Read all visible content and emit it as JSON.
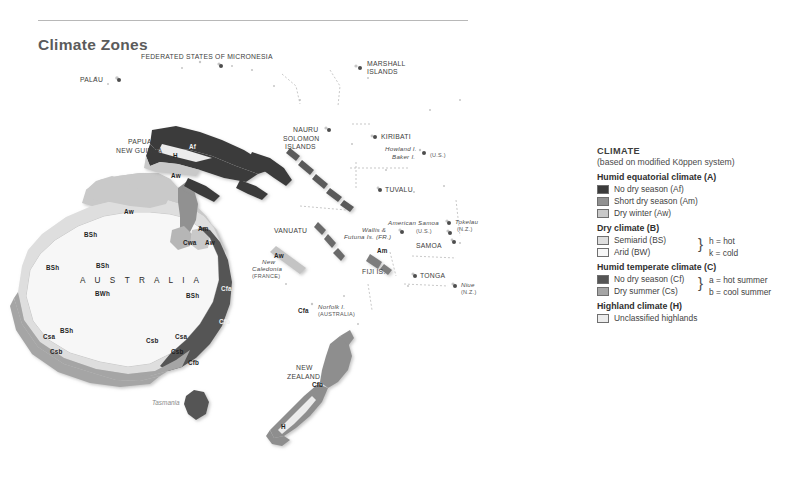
{
  "header": {
    "title": "Climate Zones"
  },
  "map": {
    "ocean_color": "#ffffff",
    "australia_word": "A U S T R A L I A",
    "tasmania_word": "Tasmania",
    "places": [
      {
        "name": "FEDERATED STATES OF MICRONESIA",
        "x": 141,
        "y": 13,
        "style": "cap",
        "align": "left",
        "dot": {
          "x": 219,
          "y": 24
        }
      },
      {
        "name": "PALAU",
        "x": 80,
        "y": 36,
        "style": "cap",
        "align": "left",
        "dot": {
          "x": 117,
          "y": 38
        }
      },
      {
        "name": "MARSHALL",
        "x": 367,
        "y": 20,
        "style": "cap",
        "align": "left"
      },
      {
        "name": "ISLANDS",
        "x": 367,
        "y": 28,
        "style": "cap",
        "align": "left",
        "dot": {
          "x": 358,
          "y": 26
        }
      },
      {
        "name": "NAURU",
        "x": 293,
        "y": 86,
        "style": "cap",
        "align": "left",
        "dot": {
          "x": 327,
          "y": 88
        }
      },
      {
        "name": "KIRIBATI",
        "x": 381,
        "y": 93,
        "style": "cap",
        "align": "left",
        "dot": {
          "x": 373,
          "y": 95
        }
      },
      {
        "name": "Howland I.",
        "x": 385,
        "y": 106,
        "style": "ital",
        "align": "left"
      },
      {
        "name": "Baker I.",
        "x": 392,
        "y": 114,
        "style": "ital",
        "align": "left",
        "dot": {
          "x": 422,
          "y": 111
        }
      },
      {
        "name": "(U.S.)",
        "x": 430,
        "y": 112,
        "style": "sub",
        "align": "left"
      },
      {
        "name": "PAPUA",
        "x": 128,
        "y": 98,
        "style": "cap",
        "align": "left"
      },
      {
        "name": "NEW GUINEA",
        "x": 116,
        "y": 107,
        "style": "cap",
        "align": "left"
      },
      {
        "name": "SOLOMON",
        "x": 283,
        "y": 95,
        "style": "cap",
        "align": "left"
      },
      {
        "name": "ISLANDS",
        "x": 285,
        "y": 103,
        "style": "cap",
        "align": "left"
      },
      {
        "name": "TUVALU",
        "x": 385,
        "y": 146,
        "style": "cap",
        "align": "left",
        "dot": {
          "x": 378,
          "y": 148
        }
      },
      {
        "name": "VANUATU",
        "x": 274,
        "y": 187,
        "style": "cap",
        "align": "left"
      },
      {
        "name": "New",
        "x": 262,
        "y": 219,
        "style": "ital",
        "align": "left"
      },
      {
        "name": "Caledonia",
        "x": 252,
        "y": 226,
        "style": "ital",
        "align": "left"
      },
      {
        "name": "(FRANCE)",
        "x": 252,
        "y": 233,
        "style": "sub",
        "align": "left"
      },
      {
        "name": "Wallis &",
        "x": 362,
        "y": 187,
        "style": "ital",
        "align": "left",
        "dot": {
          "x": 400,
          "y": 190
        }
      },
      {
        "name": "Futuna Is. (FR.)",
        "x": 344,
        "y": 194,
        "style": "ital",
        "align": "left"
      },
      {
        "name": "American Samoa",
        "x": 388,
        "y": 180,
        "style": "ital",
        "align": "left"
      },
      {
        "name": "(U.S.)",
        "x": 416,
        "y": 188,
        "style": "sub",
        "align": "left",
        "dot": {
          "x": 448,
          "y": 191
        }
      },
      {
        "name": "SAMOA",
        "x": 416,
        "y": 202,
        "style": "cap",
        "align": "left",
        "dot": {
          "x": 452,
          "y": 200
        }
      },
      {
        "name": "Tokelau",
        "x": 455,
        "y": 179,
        "style": "ital",
        "align": "left",
        "dot": {
          "x": 447,
          "y": 181
        }
      },
      {
        "name": "(N.Z.)",
        "x": 457,
        "y": 186,
        "style": "sub",
        "align": "left"
      },
      {
        "name": "FIJI IS.",
        "x": 362,
        "y": 228,
        "style": "cap",
        "align": "left"
      },
      {
        "name": "TONGA",
        "x": 420,
        "y": 232,
        "style": "cap",
        "align": "left",
        "dot": {
          "x": 413,
          "y": 234
        }
      },
      {
        "name": "Niue",
        "x": 461,
        "y": 242,
        "style": "ital",
        "align": "left",
        "dot": {
          "x": 453,
          "y": 244
        }
      },
      {
        "name": "(N.Z.)",
        "x": 461,
        "y": 249,
        "style": "sub",
        "align": "left"
      },
      {
        "name": "Norfolk I.",
        "x": 318,
        "y": 264,
        "style": "ital",
        "align": "left"
      },
      {
        "name": "(AUSTRALIA)",
        "x": 318,
        "y": 271,
        "style": "sub",
        "align": "left"
      },
      {
        "name": "NEW",
        "x": 296,
        "y": 324,
        "style": "cap",
        "align": "left"
      },
      {
        "name": "ZEALAND",
        "x": 287,
        "y": 333,
        "style": "cap",
        "align": "left"
      }
    ],
    "zone_labels": [
      {
        "code": "Af",
        "x": 189,
        "y": 103,
        "light": true
      },
      {
        "code": "H",
        "x": 173,
        "y": 112,
        "light": false
      },
      {
        "code": "Aw",
        "x": 171,
        "y": 132,
        "light": false
      },
      {
        "code": "Aw",
        "x": 124,
        "y": 168,
        "light": false
      },
      {
        "code": "Am",
        "x": 198,
        "y": 185,
        "light": false
      },
      {
        "code": "Cwa",
        "x": 183,
        "y": 199,
        "light": false
      },
      {
        "code": "Aw",
        "x": 205,
        "y": 199,
        "light": false
      },
      {
        "code": "BSh",
        "x": 84,
        "y": 191,
        "light": false
      },
      {
        "code": "BSh",
        "x": 46,
        "y": 224,
        "light": false
      },
      {
        "code": "BSh",
        "x": 96,
        "y": 222,
        "light": false
      },
      {
        "code": "BWh",
        "x": 95,
        "y": 250,
        "light": false
      },
      {
        "code": "BSh",
        "x": 186,
        "y": 252,
        "light": false
      },
      {
        "code": "Cfa",
        "x": 221,
        "y": 245,
        "light": true
      },
      {
        "code": "Cfb",
        "x": 219,
        "y": 278,
        "light": true
      },
      {
        "code": "BSh",
        "x": 60,
        "y": 287,
        "light": false
      },
      {
        "code": "Csa",
        "x": 43,
        "y": 293,
        "light": false
      },
      {
        "code": "Csb",
        "x": 50,
        "y": 308,
        "light": false
      },
      {
        "code": "Csb",
        "x": 146,
        "y": 297,
        "light": false
      },
      {
        "code": "Csa",
        "x": 175,
        "y": 293,
        "light": false
      },
      {
        "code": "Csb",
        "x": 171,
        "y": 308,
        "light": false
      },
      {
        "code": "Cfb",
        "x": 188,
        "y": 319,
        "light": false
      },
      {
        "code": "Aw",
        "x": 274,
        "y": 212,
        "light": false
      },
      {
        "code": "Am",
        "x": 377,
        "y": 207,
        "light": false
      },
      {
        "code": "Cfa",
        "x": 298,
        "y": 267,
        "light": false
      },
      {
        "code": "Cfb",
        "x": 312,
        "y": 341,
        "light": false
      },
      {
        "code": "H",
        "x": 281,
        "y": 383,
        "light": false
      }
    ]
  },
  "legend": {
    "title": "CLIMATE",
    "subtitle": "(based on modified Köppen system)",
    "groups": [
      {
        "heading": "Humid equatorial climate (A)",
        "items": [
          {
            "label": "No dry season (Af)",
            "color": "#3b3b3b"
          },
          {
            "label": "Short dry season (Am)",
            "color": "#919191"
          },
          {
            "label": "Dry winter (Aw)",
            "color": "#c9c9c9"
          }
        ],
        "notes": []
      },
      {
        "heading": "Dry climate (B)",
        "items": [
          {
            "label": "Semiarid (BS)",
            "color": "#dedede"
          },
          {
            "label": "Arid (BW)",
            "color": "#f7f7f7"
          }
        ],
        "notes": [
          "h = hot",
          "k = cold"
        ]
      },
      {
        "heading": "Humid temperate climate (C)",
        "items": [
          {
            "label": "No dry season (Cf)",
            "color": "#555555"
          },
          {
            "label": "Dry summer (Cs)",
            "color": "#a5a5a5"
          }
        ],
        "notes": [
          "a = hot summer",
          "b = cool summer"
        ]
      },
      {
        "heading": "Highland climate (H)",
        "items": [
          {
            "label": "Unclassified highlands",
            "color": "#ececec"
          }
        ],
        "notes": []
      }
    ]
  }
}
